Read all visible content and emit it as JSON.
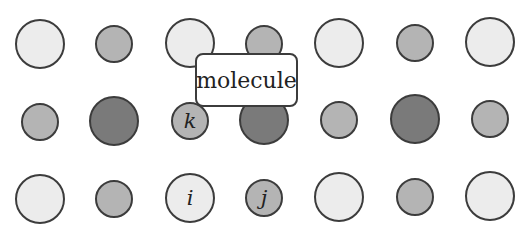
{
  "diagram": {
    "title_label": "molecule",
    "label_box": {
      "x": 195,
      "y": 53,
      "w": 103,
      "h": 54
    },
    "colors": {
      "light": "#ececec",
      "medium": "#b4b4b4",
      "dark": "#7a7a7a",
      "stroke": "#3c3c3c",
      "background": "#ffffff"
    },
    "atoms": [
      {
        "row": 1,
        "col": 1,
        "cx": 40,
        "cy": 44,
        "r": 25,
        "shade": "light",
        "label": ""
      },
      {
        "row": 1,
        "col": 2,
        "cx": 114,
        "cy": 44,
        "r": 19,
        "shade": "medium",
        "label": ""
      },
      {
        "row": 1,
        "col": 3,
        "cx": 190,
        "cy": 43,
        "r": 25,
        "shade": "light",
        "label": ""
      },
      {
        "row": 1,
        "col": 4,
        "cx": 264,
        "cy": 44,
        "r": 19,
        "shade": "medium",
        "label": ""
      },
      {
        "row": 1,
        "col": 5,
        "cx": 339,
        "cy": 43,
        "r": 25,
        "shade": "light",
        "label": ""
      },
      {
        "row": 1,
        "col": 6,
        "cx": 415,
        "cy": 43,
        "r": 19,
        "shade": "medium",
        "label": ""
      },
      {
        "row": 1,
        "col": 7,
        "cx": 490,
        "cy": 42,
        "r": 25,
        "shade": "light",
        "label": ""
      },
      {
        "row": 2,
        "col": 1,
        "cx": 40,
        "cy": 122,
        "r": 19,
        "shade": "medium",
        "label": ""
      },
      {
        "row": 2,
        "col": 2,
        "cx": 114,
        "cy": 121,
        "r": 25,
        "shade": "dark",
        "label": ""
      },
      {
        "row": 2,
        "col": 3,
        "cx": 190,
        "cy": 121,
        "r": 19,
        "shade": "medium",
        "label": "k"
      },
      {
        "row": 2,
        "col": 4,
        "cx": 264,
        "cy": 120,
        "r": 25,
        "shade": "dark",
        "label": ""
      },
      {
        "row": 2,
        "col": 5,
        "cx": 339,
        "cy": 120,
        "r": 19,
        "shade": "medium",
        "label": ""
      },
      {
        "row": 2,
        "col": 6,
        "cx": 415,
        "cy": 119,
        "r": 25,
        "shade": "dark",
        "label": ""
      },
      {
        "row": 2,
        "col": 7,
        "cx": 490,
        "cy": 119,
        "r": 19,
        "shade": "medium",
        "label": ""
      },
      {
        "row": 3,
        "col": 1,
        "cx": 40,
        "cy": 199,
        "r": 25,
        "shade": "light",
        "label": ""
      },
      {
        "row": 3,
        "col": 2,
        "cx": 114,
        "cy": 199,
        "r": 19,
        "shade": "medium",
        "label": ""
      },
      {
        "row": 3,
        "col": 3,
        "cx": 190,
        "cy": 198,
        "r": 25,
        "shade": "light",
        "label": "i"
      },
      {
        "row": 3,
        "col": 4,
        "cx": 264,
        "cy": 198,
        "r": 19,
        "shade": "medium",
        "label": "j"
      },
      {
        "row": 3,
        "col": 5,
        "cx": 339,
        "cy": 197,
        "r": 25,
        "shade": "light",
        "label": ""
      },
      {
        "row": 3,
        "col": 6,
        "cx": 415,
        "cy": 197,
        "r": 19,
        "shade": "medium",
        "label": ""
      },
      {
        "row": 3,
        "col": 7,
        "cx": 490,
        "cy": 196,
        "r": 25,
        "shade": "light",
        "label": ""
      }
    ]
  }
}
